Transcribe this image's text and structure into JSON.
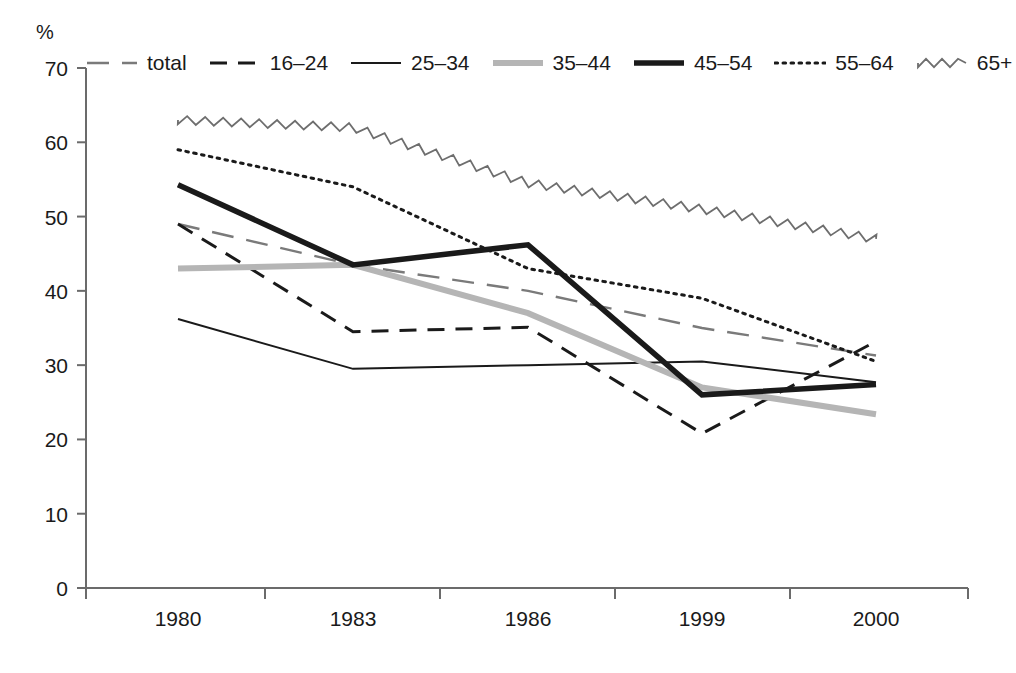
{
  "chart_data": {
    "type": "line",
    "title": "",
    "xlabel": "",
    "ylabel": "%",
    "unit_label": "%",
    "categories": [
      "1980",
      "1983",
      "1986",
      "1999",
      "2000"
    ],
    "x_tick_labels": [
      "1980",
      "1983",
      "1986",
      "1999",
      "2000"
    ],
    "y_tick_labels": [
      "0",
      "10",
      "20",
      "30",
      "40",
      "50",
      "60",
      "70"
    ],
    "y_tick_values": [
      0,
      10,
      20,
      30,
      40,
      50,
      60,
      70
    ],
    "ylim": [
      0,
      70
    ],
    "grid": false,
    "legend_position": "top",
    "series": [
      {
        "name": "total",
        "style": "long-dash",
        "color": "#7a7a7a",
        "width": 2.4,
        "values": [
          49.0,
          43.5,
          40.0,
          35.0,
          31.3
        ]
      },
      {
        "name": "16–24",
        "style": "dash",
        "color": "#1a1a1a",
        "width": 3.0,
        "values": [
          49.0,
          34.5,
          35.1,
          20.8,
          33.2
        ]
      },
      {
        "name": "25–34",
        "style": "solid",
        "color": "#1a1a1a",
        "width": 2.0,
        "values": [
          36.2,
          29.5,
          30.0,
          30.5,
          27.7
        ]
      },
      {
        "name": "35–44",
        "style": "solid",
        "color": "#b5b5b5",
        "width": 6.0,
        "values": [
          43.0,
          43.5,
          37.0,
          27.0,
          23.4
        ]
      },
      {
        "name": "45–54",
        "style": "solid",
        "color": "#1a1a1a",
        "width": 5.5,
        "values": [
          54.3,
          43.5,
          46.2,
          26.0,
          27.4
        ]
      },
      {
        "name": "55–64",
        "style": "dotted",
        "color": "#1a1a1a",
        "width": 3.0,
        "values": [
          59.0,
          54.0,
          43.0,
          39.0,
          30.5
        ]
      },
      {
        "name": "65+",
        "style": "zigzag",
        "color": "#6e6e6e",
        "width": 1.8,
        "values": [
          63.0,
          62.0,
          54.5,
          51.0,
          47.0
        ]
      }
    ]
  },
  "legend": {
    "items": [
      {
        "label": "total",
        "swatch": "long-dash-swatch"
      },
      {
        "label": "16–24",
        "swatch": "dash-swatch"
      },
      {
        "label": "25–34",
        "swatch": "solid-thin-swatch"
      },
      {
        "label": "35–44",
        "swatch": "solid-gray-thick-swatch"
      },
      {
        "label": "45–54",
        "swatch": "solid-black-thick-swatch"
      },
      {
        "label": "55–64",
        "swatch": "dotted-swatch"
      },
      {
        "label": "65+",
        "swatch": "zigzag-swatch"
      }
    ]
  },
  "axes": {
    "unit": "%"
  }
}
